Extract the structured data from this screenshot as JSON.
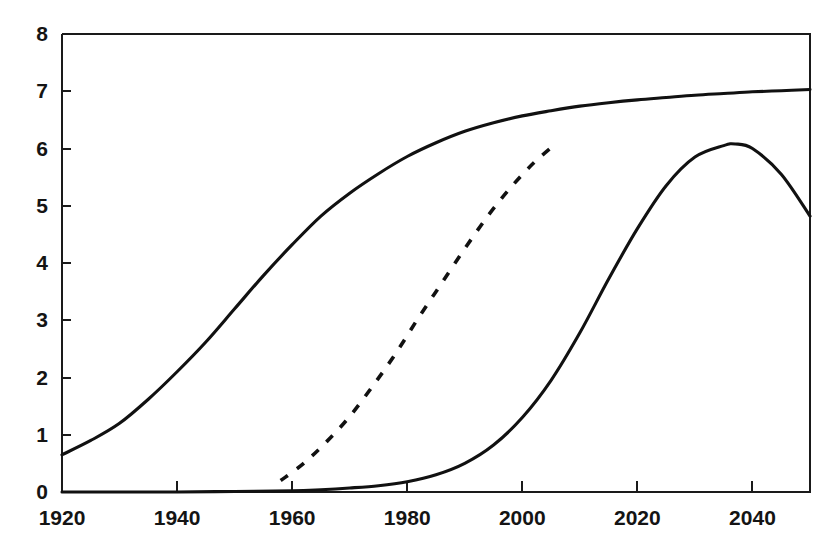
{
  "chart_data": {
    "type": "line",
    "title": "",
    "subtitle": "",
    "xlabel": "",
    "ylabel": "",
    "xlim": [
      1920,
      2050
    ],
    "ylim": [
      0,
      8
    ],
    "grid": false,
    "legend": false,
    "legend_position": "none",
    "xticks": [
      1920,
      1940,
      1960,
      1980,
      2000,
      2020,
      2040
    ],
    "xtick_labels": [
      "1920",
      "1940",
      "1960",
      "1980",
      "2000",
      "2020",
      "2040"
    ],
    "yticks": [
      0,
      1,
      2,
      3,
      4,
      5,
      6,
      7,
      8
    ],
    "ytick_labels": [
      "0",
      "1",
      "2",
      "3",
      "4",
      "5",
      "6",
      "7",
      "8"
    ],
    "series": [
      {
        "name": "upper-solid-curve",
        "style": "solid",
        "color": "#111111",
        "x": [
          1920,
          1925,
          1930,
          1935,
          1940,
          1945,
          1950,
          1955,
          1960,
          1965,
          1970,
          1975,
          1980,
          1985,
          1990,
          1995,
          2000,
          2005,
          2010,
          2015,
          2020,
          2025,
          2030,
          2035,
          2040,
          2045,
          2050
        ],
        "values": [
          0.65,
          0.9,
          1.2,
          1.62,
          2.1,
          2.62,
          3.2,
          3.78,
          4.32,
          4.82,
          5.22,
          5.56,
          5.86,
          6.1,
          6.3,
          6.45,
          6.57,
          6.66,
          6.74,
          6.8,
          6.85,
          6.89,
          6.93,
          6.96,
          6.99,
          7.01,
          7.03
        ]
      },
      {
        "name": "middle-dashed-curve",
        "style": "dashed",
        "color": "#111111",
        "x": [
          1958,
          1962,
          1966,
          1970,
          1974,
          1978,
          1982,
          1986,
          1990,
          1994,
          1998,
          2002,
          2006
        ],
        "values": [
          0.2,
          0.5,
          0.88,
          1.32,
          1.85,
          2.42,
          3.05,
          3.65,
          4.25,
          4.82,
          5.32,
          5.75,
          6.1
        ]
      },
      {
        "name": "lower-solid-peaked-curve",
        "style": "solid",
        "color": "#111111",
        "x": [
          1920,
          1930,
          1940,
          1950,
          1960,
          1965,
          1970,
          1975,
          1980,
          1985,
          1990,
          1995,
          2000,
          2005,
          2010,
          2015,
          2020,
          2025,
          2030,
          2035,
          2037,
          2040,
          2045,
          2050
        ],
        "values": [
          0.0,
          0.0,
          0.0,
          0.01,
          0.02,
          0.04,
          0.07,
          0.11,
          0.18,
          0.3,
          0.5,
          0.82,
          1.3,
          1.95,
          2.78,
          3.72,
          4.6,
          5.35,
          5.85,
          6.05,
          6.08,
          6.0,
          5.55,
          4.82
        ]
      }
    ]
  }
}
